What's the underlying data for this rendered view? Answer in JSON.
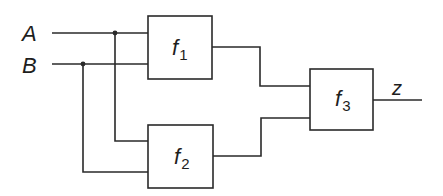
{
  "diagram": {
    "type": "logic-block-diagram",
    "inputs": [
      {
        "label": "A"
      },
      {
        "label": "B"
      }
    ],
    "output": {
      "label": "z"
    },
    "blocks": [
      {
        "name": "f",
        "subscript": "1",
        "inputs": [
          "A",
          "B"
        ]
      },
      {
        "name": "f",
        "subscript": "2",
        "inputs": [
          "A",
          "B"
        ]
      },
      {
        "name": "f",
        "subscript": "3",
        "inputs": [
          "f1",
          "f2"
        ],
        "output": "z"
      }
    ],
    "colors": {
      "line": "#2a2a2a",
      "background": "#ffffff"
    }
  }
}
